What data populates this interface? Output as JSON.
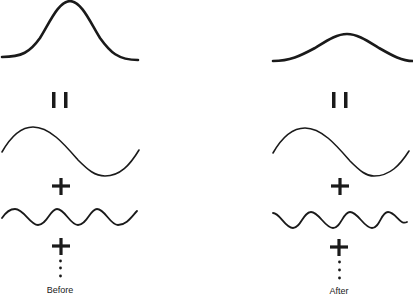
{
  "diagram": {
    "stroke_color": "#1a1a1a",
    "columns": [
      {
        "id": "before",
        "label": "Before",
        "components": [
          "gaussian-pulse (tall, narrow)",
          "equals",
          "low-frequency sine",
          "plus",
          "high-frequency sine",
          "plus",
          "ellipsis"
        ]
      },
      {
        "id": "after",
        "label": "After",
        "components": [
          "gaussian-pulse (short, wide)",
          "equals",
          "low-frequency sine",
          "plus",
          "high-frequency sine (attenuated)",
          "plus",
          "ellipsis"
        ]
      }
    ]
  }
}
